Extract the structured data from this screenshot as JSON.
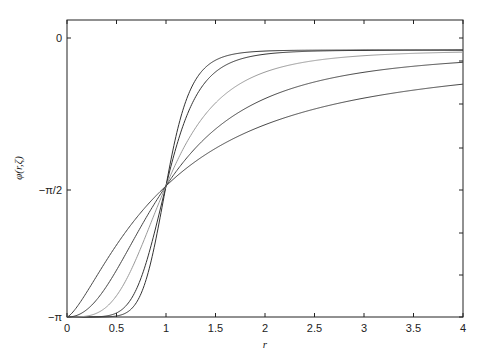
{
  "chart_data": {
    "type": "line",
    "title": "",
    "xlabel": "r",
    "ylabel": "φ(r,ζ)",
    "xlim": [
      0,
      4
    ],
    "ylim": [
      "-π",
      "0"
    ],
    "x_ticks": [
      "0",
      "0.5",
      "1",
      "1.5",
      "2",
      "2.5",
      "3",
      "3.5",
      "4"
    ],
    "y_ticks": [
      "0",
      "−π/2",
      "−π"
    ],
    "grid": false,
    "legend": null,
    "note": "Family of curves all passing through (0,-π) and (1,-π/2), rising toward ~0 as r increases; steepness varies per curve",
    "series": [
      {
        "name": "curve-1",
        "color": "#333333",
        "steepness": 8,
        "x": [
          0,
          0.5,
          0.8,
          1,
          1.2,
          1.5,
          2,
          3,
          4
        ],
        "y": [
          -3.14,
          -3.13,
          -2.9,
          -1.57,
          -0.5,
          -0.25,
          -0.17,
          -0.15,
          -0.15
        ]
      },
      {
        "name": "curve-2",
        "color": "#333333",
        "steepness": 6,
        "x": [
          0,
          0.5,
          0.8,
          1,
          1.2,
          1.5,
          2,
          3,
          4
        ],
        "y": [
          -3.14,
          -3.1,
          -2.8,
          -1.57,
          -0.6,
          -0.3,
          -0.19,
          -0.16,
          -0.15
        ]
      },
      {
        "name": "curve-3",
        "color": "#999999",
        "steepness": 3.5,
        "x": [
          0,
          0.5,
          0.8,
          1,
          1.2,
          1.5,
          2,
          3,
          4
        ],
        "y": [
          -3.14,
          -2.95,
          -2.5,
          -1.57,
          -0.9,
          -0.5,
          -0.3,
          -0.23,
          -0.2
        ]
      },
      {
        "name": "curve-4",
        "color": "#444444",
        "steepness": 2.2,
        "x": [
          0,
          0.5,
          0.8,
          1,
          1.2,
          1.5,
          2,
          3,
          4
        ],
        "y": [
          -3.14,
          -2.7,
          -2.15,
          -1.57,
          -1.1,
          -0.8,
          -0.55,
          -0.4,
          -0.3
        ]
      },
      {
        "name": "curve-5",
        "color": "#444444",
        "steepness": 1.4,
        "x": [
          0,
          0.5,
          0.8,
          1,
          1.2,
          1.5,
          2,
          3,
          4
        ],
        "y": [
          -3.14,
          -2.4,
          -1.9,
          -1.57,
          -1.3,
          -1.05,
          -0.8,
          -0.6,
          -0.5
        ]
      }
    ]
  }
}
